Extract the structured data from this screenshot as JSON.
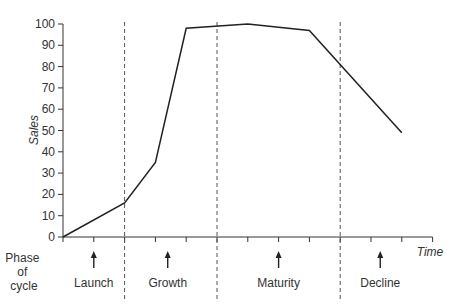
{
  "chart_data": {
    "type": "line",
    "title": "",
    "xlabel": "Time",
    "ylabel": "Sales",
    "ylim": [
      0,
      100
    ],
    "yticks": [
      0,
      10,
      20,
      30,
      40,
      50,
      60,
      70,
      80,
      90,
      100
    ],
    "grid": false,
    "x_tick_count": 13,
    "x": [
      0,
      2,
      3,
      4,
      6,
      8,
      11
    ],
    "series": [
      {
        "name": "Sales",
        "values": [
          0,
          16,
          35,
          98,
          100,
          97,
          49
        ]
      }
    ],
    "phase_boundaries_x": [
      2,
      5,
      9
    ],
    "phase_row_label": [
      "Phase",
      "of",
      "cycle"
    ],
    "phases": [
      {
        "label": "Launch",
        "arrow_x": 1
      },
      {
        "label": "Growth",
        "arrow_x": 3.4
      },
      {
        "label": "Maturity",
        "arrow_x": 7
      },
      {
        "label": "Decline",
        "arrow_x": 10.3
      }
    ]
  }
}
